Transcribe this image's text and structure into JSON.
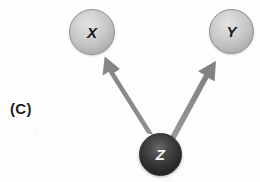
{
  "figure": {
    "panel_label": "(C)",
    "width": 260,
    "height": 182,
    "background_color": "#fefefe"
  },
  "diagram": {
    "type": "causal-graph",
    "nodes": [
      {
        "id": "X",
        "label": "X",
        "style": "light-sphere",
        "fill_color": "#c2c2c2",
        "text_color": "#1a1a1a",
        "cx": 92,
        "cy": 32,
        "r": 23
      },
      {
        "id": "Y",
        "label": "Y",
        "style": "light-sphere",
        "fill_color": "#c2c2c2",
        "text_color": "#1a1a1a",
        "cx": 231,
        "cy": 31,
        "r": 22
      },
      {
        "id": "Z",
        "label": "Z",
        "style": "dark-sphere",
        "fill_color": "#2d2d2d",
        "text_color": "#f8f8f8",
        "cx": 160,
        "cy": 154,
        "r": 21
      }
    ],
    "edges": [
      {
        "id": "z-to-x",
        "from": "Z",
        "to": "X",
        "directed": true,
        "color": "#8d8d8d",
        "shaft_width": 8
      },
      {
        "id": "z-to-y",
        "from": "Z",
        "to": "Y",
        "directed": true,
        "color": "#8d8d8d",
        "shaft_width": 8
      }
    ]
  }
}
